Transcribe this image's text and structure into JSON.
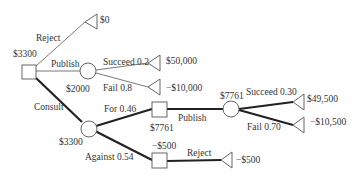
{
  "diagram": {
    "type": "decision-tree",
    "nodes": {
      "root": {
        "kind": "decision",
        "value": "$3300"
      },
      "publish_chance": {
        "kind": "chance",
        "value": "$2000"
      },
      "consult_chance": {
        "kind": "chance",
        "value": "$3300"
      },
      "for_decision": {
        "kind": "decision",
        "value": "$7761"
      },
      "for_publish_chance": {
        "kind": "chance",
        "value": "$7761"
      },
      "against_decision": {
        "kind": "decision",
        "value": "−$500"
      }
    },
    "branches": {
      "reject": {
        "label": "Reject",
        "payoff": "$0"
      },
      "publish": {
        "label": "Publish"
      },
      "publish_succeed": {
        "label": "Succeed  0.2",
        "payoff": "$50,000"
      },
      "publish_fail": {
        "label": "Fail 0.8",
        "payoff": "−$10,000"
      },
      "consult": {
        "label": "Consult"
      },
      "for": {
        "label": "For  0.46"
      },
      "against": {
        "label": "Against 0.54"
      },
      "for_publish": {
        "label": "Publish"
      },
      "for_succeed": {
        "label": "Succeed 0.30",
        "payoff": "$49,500"
      },
      "for_fail": {
        "label": "Fail 0.70",
        "payoff": "−$10,500"
      },
      "against_reject": {
        "label": "Reject",
        "payoff": "−$500"
      }
    }
  }
}
